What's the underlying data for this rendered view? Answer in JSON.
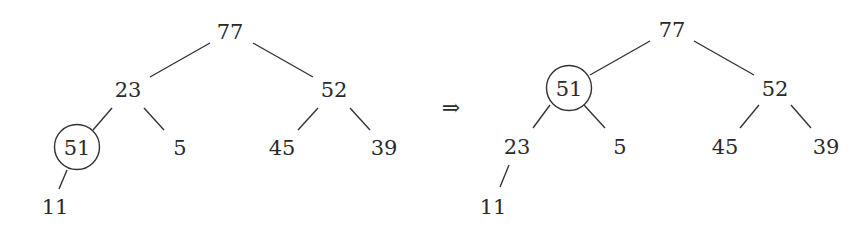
{
  "diagram": {
    "type": "binary-heap-sift-up",
    "arrow": "⇒",
    "before": {
      "nodes": [
        {
          "id": "a77",
          "label": "77",
          "x": 230,
          "y": 32,
          "highlight": false
        },
        {
          "id": "a23",
          "label": "23",
          "x": 128,
          "y": 90,
          "highlight": false
        },
        {
          "id": "a52",
          "label": "52",
          "x": 334,
          "y": 90,
          "highlight": false
        },
        {
          "id": "a51",
          "label": "51",
          "x": 77,
          "y": 148,
          "highlight": true
        },
        {
          "id": "a5",
          "label": "5",
          "x": 180,
          "y": 148,
          "highlight": false
        },
        {
          "id": "a45",
          "label": "45",
          "x": 282,
          "y": 148,
          "highlight": false
        },
        {
          "id": "a39",
          "label": "39",
          "x": 384,
          "y": 148,
          "highlight": false
        },
        {
          "id": "a11",
          "label": "11",
          "x": 55,
          "y": 207,
          "highlight": false
        }
      ],
      "edges": [
        {
          "from": "77",
          "to": "23"
        },
        {
          "from": "77",
          "to": "52"
        },
        {
          "from": "23",
          "to": "51"
        },
        {
          "from": "23",
          "to": "5"
        },
        {
          "from": "52",
          "to": "45"
        },
        {
          "from": "52",
          "to": "39"
        },
        {
          "from": "51",
          "to": "11"
        }
      ]
    },
    "after": {
      "nodes": [
        {
          "id": "b77",
          "label": "77",
          "x": 672,
          "y": 30,
          "highlight": false
        },
        {
          "id": "b51",
          "label": "51",
          "x": 569,
          "y": 88,
          "highlight": true
        },
        {
          "id": "b52",
          "label": "52",
          "x": 775,
          "y": 88,
          "highlight": false
        },
        {
          "id": "b23",
          "label": "23",
          "x": 517,
          "y": 147,
          "highlight": false
        },
        {
          "id": "b5",
          "label": "5",
          "x": 620,
          "y": 147,
          "highlight": false
        },
        {
          "id": "b45",
          "label": "45",
          "x": 725,
          "y": 147,
          "highlight": false
        },
        {
          "id": "b39",
          "label": "39",
          "x": 826,
          "y": 147,
          "highlight": false
        },
        {
          "id": "b11",
          "label": "11",
          "x": 493,
          "y": 207,
          "highlight": false
        }
      ],
      "edges": [
        {
          "from": "77",
          "to": "51"
        },
        {
          "from": "77",
          "to": "52"
        },
        {
          "from": "51",
          "to": "23"
        },
        {
          "from": "51",
          "to": "5"
        },
        {
          "from": "52",
          "to": "45"
        },
        {
          "from": "52",
          "to": "39"
        },
        {
          "from": "23",
          "to": "11"
        }
      ]
    },
    "colors": {
      "stroke": "#333333",
      "text": "#2a2a2a",
      "background": "#ffffff"
    }
  }
}
